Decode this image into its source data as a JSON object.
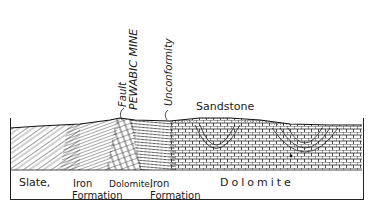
{
  "diagram": {
    "type": "geological-cross-section",
    "annotations": {
      "fault": "Fault",
      "mine": "PEWABIC MINE",
      "unconformity": "Unconformity",
      "sandstone": "Sandstone"
    },
    "units": [
      {
        "label_line1": "Slate,",
        "label_line2": ""
      },
      {
        "label_line1": "Iron",
        "label_line2": "Formation"
      },
      {
        "label_line1": "Dolomite,",
        "label_line2": ""
      },
      {
        "label_line1": "Iron",
        "label_line2": "Formation"
      },
      {
        "label_line1": "Dolomite",
        "label_line2": ""
      }
    ],
    "colors": {
      "ink": "#1a1a1a",
      "background": "#ffffff"
    }
  }
}
